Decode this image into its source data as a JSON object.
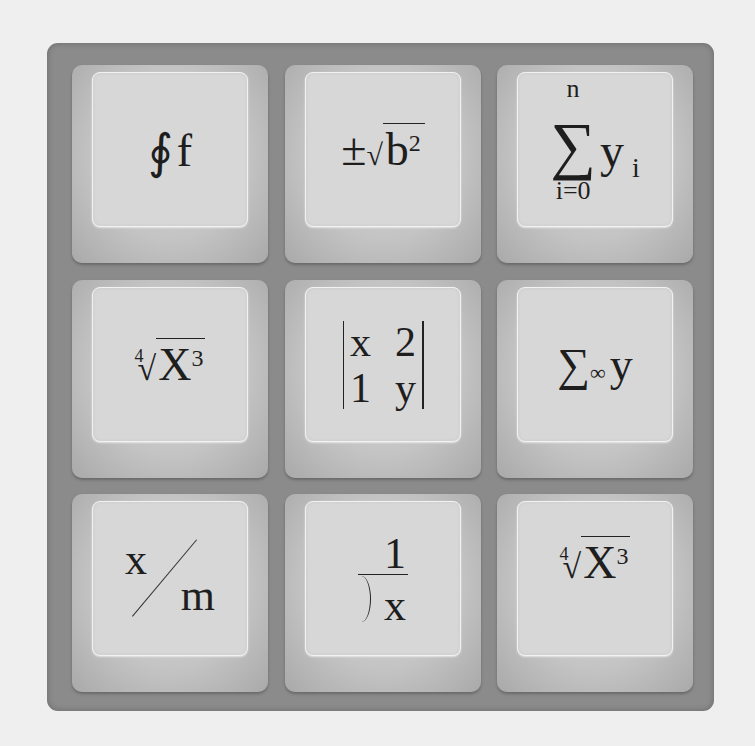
{
  "keys": [
    {
      "id": "contour-integral",
      "symbol": "∮",
      "text": "f"
    },
    {
      "id": "plus-minus-sqrt",
      "prefix": "±",
      "radical": "√",
      "base": "b",
      "exponent": "2"
    },
    {
      "id": "summation",
      "sigma": "∑",
      "upper": "n",
      "lower": "i=0",
      "body": "y",
      "subscript": "i"
    },
    {
      "id": "fourth-root",
      "index": "4",
      "radical": "√",
      "base": "X",
      "exponent": "3"
    },
    {
      "id": "determinant",
      "cells": [
        "x",
        "2",
        "1",
        "y"
      ]
    },
    {
      "id": "sum-infinity",
      "sigma": "∑",
      "limit": "∞",
      "body": "y"
    },
    {
      "id": "fraction",
      "numerator": "x",
      "denominator": "m"
    },
    {
      "id": "long-division",
      "numerator": "1",
      "divisor": "x"
    },
    {
      "id": "fourth-root-2",
      "index": "4",
      "radical": "√",
      "base": "X",
      "exponent": "3"
    }
  ]
}
